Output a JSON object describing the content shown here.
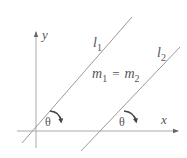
{
  "diagram": {
    "axes": {
      "x_label": "x",
      "y_label": "y"
    },
    "lines": [
      {
        "name": "l1",
        "label_base": "l",
        "label_sub": "1"
      },
      {
        "name": "l2",
        "label_base": "l",
        "label_sub": "2"
      }
    ],
    "equation": {
      "lhs_base": "m",
      "lhs_sub": "1",
      "op": "=",
      "rhs_base": "m",
      "rhs_sub": "2"
    },
    "angles": [
      {
        "label": "θ",
        "line": "l1"
      },
      {
        "label": "θ",
        "line": "l2"
      }
    ],
    "colors": {
      "line": "#9a9a9a",
      "axis": "#aaaaaa",
      "text": "#555555",
      "arrow": "#555555"
    }
  }
}
